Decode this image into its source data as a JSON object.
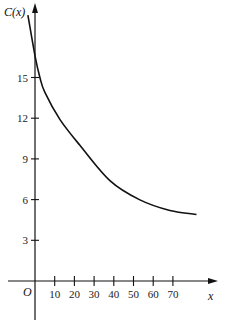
{
  "chart_data": {
    "type": "line",
    "title": "",
    "xlabel": "x",
    "ylabel": "C(x)",
    "origin_label": "O",
    "x_ticks": [
      10,
      20,
      30,
      40,
      50,
      60,
      70
    ],
    "x_tick_labels": [
      "10",
      "20",
      "30",
      "40",
      "50",
      "60",
      "70"
    ],
    "y_ticks": [
      3,
      6,
      9,
      12,
      15
    ],
    "y_tick_labels": [
      "3",
      "6",
      "9",
      "12",
      "15"
    ],
    "xlim": [
      -14,
      92
    ],
    "ylim": [
      -3,
      20
    ],
    "grid": false,
    "legend": null,
    "series": [
      {
        "name": "C(x)",
        "x": [
          -3.6,
          0,
          2.5,
          5,
          12.7,
          22.8,
          38,
          53,
          68.5,
          82
        ],
        "values": [
          19.6,
          16.6,
          15.0,
          13.9,
          11.9,
          10.0,
          7.4,
          6.0,
          5.2,
          4.9
        ]
      }
    ]
  }
}
